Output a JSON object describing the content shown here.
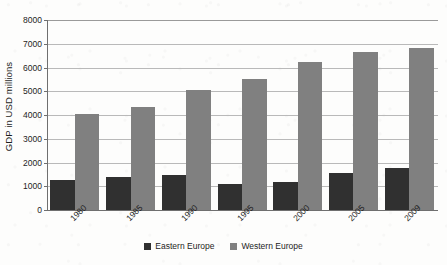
{
  "chart_data": {
    "type": "bar",
    "title": "",
    "subtitle": "",
    "xlabel": "",
    "ylabel": "GDP in USD millions",
    "categories": [
      "1980",
      "1985",
      "1990",
      "1995",
      "2000",
      "2005",
      "2009"
    ],
    "series": [
      {
        "name": "Eastern Europe",
        "color": "#303030",
        "values": [
          1250,
          1400,
          1480,
          1100,
          1200,
          1550,
          1780
        ]
      },
      {
        "name": "Western Europe",
        "color": "#808080",
        "values": [
          4050,
          4330,
          5070,
          5500,
          6250,
          6650,
          6830
        ]
      }
    ],
    "ylim": [
      0,
      8000
    ],
    "y_ticks": [
      0,
      1000,
      2000,
      3000,
      4000,
      5000,
      6000,
      7000,
      8000
    ],
    "y_tick_labels": [
      "0",
      "1000",
      "2000",
      "3000",
      "4000",
      "5000",
      "6000",
      "7000",
      "8000"
    ],
    "grid": true,
    "grid_axis": "y",
    "legend_position": "bottom-center",
    "x_tick_label_rotation": -45,
    "bar_mode": "grouped"
  },
  "legend": {
    "entries": [
      {
        "label": "Eastern Europe",
        "swatch": "dark-gray-square"
      },
      {
        "label": "Western Europe",
        "swatch": "medium-gray-square"
      }
    ]
  }
}
